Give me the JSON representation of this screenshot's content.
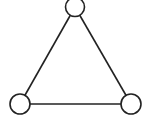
{
  "diagram": {
    "type": "graph",
    "stroke_color": "#222222",
    "fill_color": "#ffffff",
    "stroke_width": 1.6,
    "nodes": [
      {
        "id": "top",
        "cx": 75,
        "cy": 7,
        "r": 9.5
      },
      {
        "id": "bottom-left",
        "cx": 20,
        "cy": 104,
        "r": 10
      },
      {
        "id": "bottom-right",
        "cx": 131,
        "cy": 104,
        "r": 10
      }
    ],
    "edges": [
      {
        "from": "top",
        "to": "bottom-left"
      },
      {
        "from": "top",
        "to": "bottom-right"
      },
      {
        "from": "bottom-left",
        "to": "bottom-right"
      }
    ]
  }
}
